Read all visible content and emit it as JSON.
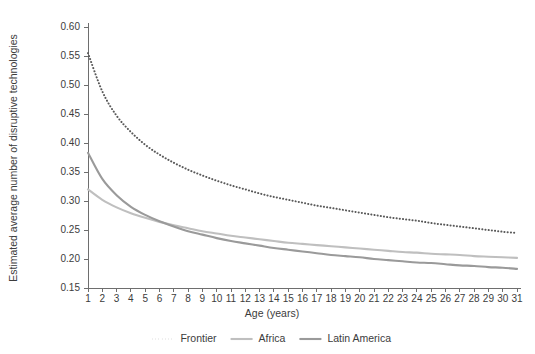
{
  "chart_data": {
    "type": "line",
    "title": "",
    "subtitle": "",
    "xlabel": "Age (years)",
    "ylabel": "Estimated average number of disruptive technologies",
    "xlim": [
      1,
      31
    ],
    "ylim": [
      0.15,
      0.6
    ],
    "grid": false,
    "legend_position": "bottom",
    "xticks": [
      1,
      2,
      3,
      4,
      5,
      6,
      7,
      8,
      9,
      10,
      11,
      12,
      13,
      14,
      15,
      16,
      17,
      18,
      19,
      20,
      21,
      22,
      23,
      24,
      25,
      26,
      27,
      28,
      29,
      30,
      31
    ],
    "xtick_labels": [
      "1",
      "2",
      "3",
      "4",
      "5",
      "6",
      "7",
      "8",
      "9",
      "10",
      "11",
      "12",
      "13",
      "14",
      "15",
      "16",
      "17",
      "18",
      "19",
      "20",
      "21",
      "22",
      "23",
      "24",
      "25",
      "26",
      "27",
      "28",
      "29",
      "30",
      "31"
    ],
    "yticks": [
      0.15,
      0.2,
      0.25,
      0.3,
      0.35,
      0.4,
      0.45,
      0.5,
      0.55,
      0.6
    ],
    "ytick_labels": [
      "0.15",
      "0.20",
      "0.25",
      "0.30",
      "0.35",
      "0.40",
      "0.45",
      "0.50",
      "0.55",
      "0.60"
    ],
    "x": [
      1,
      2,
      3,
      4,
      5,
      6,
      7,
      8,
      9,
      10,
      11,
      12,
      13,
      14,
      15,
      16,
      17,
      18,
      19,
      20,
      21,
      22,
      23,
      24,
      25,
      26,
      27,
      28,
      29,
      30,
      31
    ],
    "series": [
      {
        "name": "Frontier",
        "style": "dotted",
        "color": "#595959",
        "width": 2.0,
        "values": [
          0.555,
          0.489,
          0.447,
          0.419,
          0.397,
          0.38,
          0.366,
          0.354,
          0.344,
          0.335,
          0.327,
          0.32,
          0.313,
          0.307,
          0.302,
          0.297,
          0.292,
          0.288,
          0.284,
          0.28,
          0.276,
          0.272,
          0.269,
          0.266,
          0.262,
          0.259,
          0.256,
          0.253,
          0.25,
          0.247,
          0.245
        ]
      },
      {
        "name": "Africa",
        "style": "solid",
        "color": "#bfbfbf",
        "width": 2.1,
        "values": [
          0.32,
          0.302,
          0.289,
          0.279,
          0.271,
          0.264,
          0.258,
          0.253,
          0.248,
          0.244,
          0.24,
          0.237,
          0.234,
          0.231,
          0.228,
          0.226,
          0.224,
          0.222,
          0.22,
          0.218,
          0.216,
          0.214,
          0.212,
          0.211,
          0.209,
          0.208,
          0.207,
          0.205,
          0.204,
          0.203,
          0.202
        ]
      },
      {
        "name": "Latin America",
        "style": "solid",
        "color": "#9a9a9a",
        "width": 2.1,
        "values": [
          0.383,
          0.338,
          0.31,
          0.29,
          0.276,
          0.265,
          0.256,
          0.248,
          0.242,
          0.236,
          0.231,
          0.227,
          0.223,
          0.219,
          0.216,
          0.213,
          0.21,
          0.207,
          0.205,
          0.203,
          0.2,
          0.198,
          0.196,
          0.194,
          0.193,
          0.191,
          0.189,
          0.188,
          0.186,
          0.185,
          0.183
        ]
      }
    ]
  },
  "legend": {
    "items": [
      {
        "label": "Frontier"
      },
      {
        "label": "Africa"
      },
      {
        "label": "Latin America"
      }
    ]
  },
  "axes": {
    "x_title": "Age (years)",
    "y_title": "Estimated average number of disruptive technologies"
  }
}
